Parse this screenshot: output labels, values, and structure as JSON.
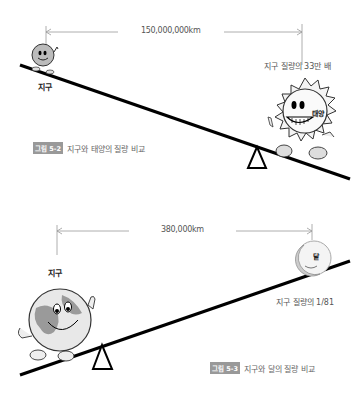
{
  "figure1": {
    "distance_label": "150,000,000km",
    "left_body": {
      "label": "지구",
      "icon": "earth-character-icon"
    },
    "right_body": {
      "label": "태양",
      "icon": "sun-character-icon",
      "mass_note": "지구 질량의 33만 배"
    },
    "caption": {
      "tag": "그림 5-2",
      "text": "지구와 태양의 질량 비교"
    },
    "fulcrum_icon": "triangle-fulcrum-icon"
  },
  "figure2": {
    "distance_label": "380,000km",
    "left_body": {
      "label": "지구",
      "icon": "earth-character-icon"
    },
    "right_body": {
      "label": "달",
      "icon": "moon-character-icon",
      "mass_note": "지구 질량의 1/81"
    },
    "caption": {
      "tag": "그림 5-3",
      "text": "지구와 달의 질량 비교"
    },
    "fulcrum_icon": "triangle-fulcrum-icon"
  },
  "colors": {
    "beam": "#000000",
    "dimension_line": "#999999",
    "caption_tag_bg": "#999999",
    "sun_fill": "#f2f2f2",
    "earth_fill": "#bdbdbd",
    "moon_fill": "#e6e6e6"
  }
}
